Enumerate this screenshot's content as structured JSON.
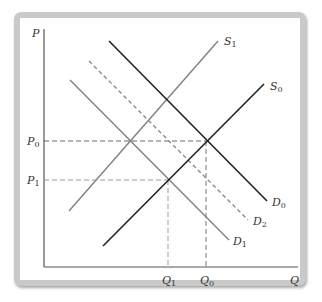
{
  "diagram": {
    "type": "supply-demand",
    "axes": {
      "y_label": "P",
      "x_label": "Q"
    },
    "price_levels": [
      {
        "id": "P0",
        "base": "P",
        "sub": "0"
      },
      {
        "id": "P1",
        "base": "P",
        "sub": "1"
      }
    ],
    "quantity_levels": [
      {
        "id": "Q1",
        "base": "Q",
        "sub": "1"
      },
      {
        "id": "Q0",
        "base": "Q",
        "sub": "0"
      }
    ],
    "curves": [
      {
        "id": "S0",
        "base": "S",
        "sub": "0",
        "kind": "supply",
        "style": "solid",
        "color": "#222222"
      },
      {
        "id": "S1",
        "base": "S",
        "sub": "1",
        "kind": "supply",
        "style": "solid",
        "color": "#808080"
      },
      {
        "id": "D0",
        "base": "D",
        "sub": "0",
        "kind": "demand",
        "style": "solid",
        "color": "#222222"
      },
      {
        "id": "D2",
        "base": "D",
        "sub": "2",
        "kind": "demand",
        "style": "dashed",
        "color": "#808080"
      },
      {
        "id": "D1",
        "base": "D",
        "sub": "1",
        "kind": "demand",
        "style": "solid",
        "color": "#808080"
      }
    ],
    "equilibria": [
      {
        "id": "E0",
        "curves": [
          "S0",
          "D0"
        ],
        "price": "P0",
        "quantity": "Q0"
      },
      {
        "id": "E1",
        "curves": [
          "S0",
          "D1"
        ],
        "price": "P1",
        "quantity": "Q1"
      }
    ],
    "colors": {
      "dark_line": "#222222",
      "gray_line": "#808080",
      "axis": "#555555",
      "frame_border": "#c9c9c9"
    }
  }
}
